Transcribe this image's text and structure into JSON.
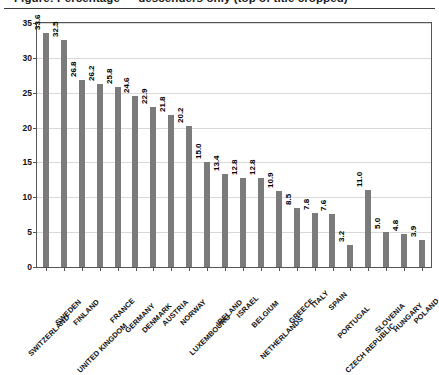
{
  "title": {
    "clipped_text": "Figure: Percentage — descenders only (top of title cropped)"
  },
  "chart_data": {
    "type": "bar",
    "title": "",
    "xlabel": "",
    "ylabel": "",
    "ylim": [
      0,
      35
    ],
    "yticks": [
      0,
      5,
      10,
      15,
      20,
      25,
      30,
      35
    ],
    "ytick_labels": [
      "0",
      "5",
      "10",
      "15",
      "20",
      "25",
      "30",
      "35"
    ],
    "grid": true,
    "legend": false,
    "bar_color": "#7b7b7b",
    "categories": [
      "SWITZERLAND",
      "SWEDEN",
      "FINLAND",
      "UNITED KINGDOM",
      "FRANCE",
      "GERMANY",
      "DENMARK",
      "AUSTRIA",
      "NORWAY",
      "LUXEMBOURG",
      "IRELAND",
      "ISRAEL",
      "BELGIUM",
      "NETHERLANDS",
      "GREECE",
      "ITALY",
      "SPAIN",
      "PORTUGAL",
      "CZECH REPUBLIC",
      "SLOVENIA",
      "HUNGARY",
      "POLAND"
    ],
    "values": [
      33.6,
      32.5,
      26.8,
      26.2,
      25.8,
      24.6,
      22.9,
      21.8,
      20.2,
      15.0,
      13.4,
      12.8,
      12.8,
      10.9,
      8.5,
      7.8,
      7.6,
      3.2,
      11.0,
      5.0,
      4.8,
      3.9
    ],
    "value_labels": [
      "33.6",
      "32.5",
      "26.8",
      "26.2",
      "25.8",
      "24.6",
      "22.9",
      "21.8",
      "20.2",
      "15.0",
      "13.4",
      "12.8",
      "12.8",
      "10.9",
      "8.5",
      "7.8",
      "7.6",
      "3.2",
      "11.0",
      "5.0",
      "4.8",
      "3.9"
    ]
  }
}
